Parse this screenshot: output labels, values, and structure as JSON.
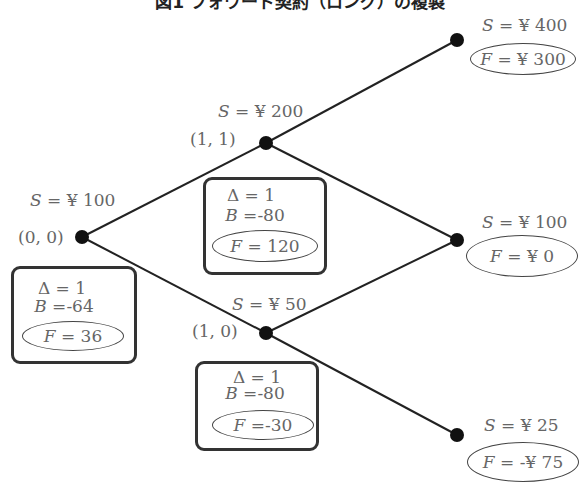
{
  "title": "図1 フォワード契約（ロング）の複製",
  "nodes": {
    "root": {
      "coord": "(0, 0)",
      "S": "¥ 100",
      "delta": "1",
      "B": "-64",
      "F": "36"
    },
    "up": {
      "coord": "(1, 1)",
      "S": "¥ 200",
      "delta": "1",
      "B": "-80",
      "F": "120"
    },
    "down": {
      "coord": "(1, 0)",
      "S": "¥ 50",
      "delta": "1",
      "B": "-80",
      "F": "-30"
    },
    "uu": {
      "S": "¥ 400",
      "F": "¥ 300"
    },
    "ud": {
      "S": "¥ 100",
      "F": "¥ 0"
    },
    "dd": {
      "S": "¥ 25",
      "F": "-¥ 75"
    }
  },
  "symbols": {
    "S": "S",
    "F": "F",
    "B": "B",
    "delta": "Δ",
    "eq": " = "
  }
}
